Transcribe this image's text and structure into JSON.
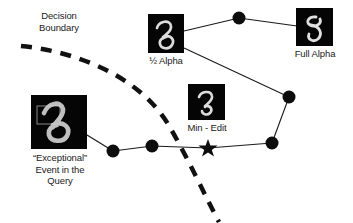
{
  "diagram": {
    "title_text_present": false,
    "background_color": "#ffffff",
    "stroke_color": "#1a1a1a",
    "node_color": "#0d0d0d",
    "thumbnail_bg": "#050505",
    "digit_stroke_color": "#d8d8d8",
    "highlight_box_color": "#8a8a8a",
    "labels": {
      "decision_boundary": "Decision\nBoundary",
      "half_alpha": "½ Alpha",
      "full_alpha": "Full Alpha",
      "min_edit": "Min - Edit",
      "exceptional_event": "“Exceptional”\nEvent in the\nQuery"
    },
    "thumbnails": [
      {
        "name": "query-digit-thumbnail",
        "label_key": "exceptional_event",
        "x": 31,
        "y": 95,
        "w": 56,
        "h": 54,
        "has_highlight_box": true
      },
      {
        "name": "half-alpha-digit-thumbnail",
        "label_key": "half_alpha",
        "x": 148,
        "y": 14,
        "w": 36,
        "h": 39,
        "has_highlight_box": false
      },
      {
        "name": "min-edit-digit-thumbnail",
        "label_key": "min_edit",
        "x": 188,
        "y": 84,
        "w": 37,
        "h": 36,
        "has_highlight_box": false
      },
      {
        "name": "full-alpha-digit-thumbnail",
        "label_key": "full_alpha",
        "x": 296,
        "y": 8,
        "w": 37,
        "h": 38,
        "has_highlight_box": false
      }
    ],
    "nodes": [
      {
        "name": "node-path-1",
        "x": 113,
        "y": 151,
        "r": 6.5
      },
      {
        "name": "node-path-2",
        "x": 152,
        "y": 146,
        "r": 6.5
      },
      {
        "name": "node-top",
        "x": 239,
        "y": 18,
        "r": 6.5
      },
      {
        "name": "node-right-upper",
        "x": 289,
        "y": 97,
        "r": 6.5
      },
      {
        "name": "node-right-lower",
        "x": 272,
        "y": 143,
        "r": 6.5
      }
    ],
    "star_marker": {
      "name": "min-edit-star-marker",
      "x": 208,
      "y": 148,
      "r": 8
    },
    "edges": [
      {
        "from": "query-thumbnail",
        "to": "node-path-1",
        "x1": 87,
        "y1": 135,
        "x2": 113,
        "y2": 151
      },
      {
        "from": "node-path-1",
        "to": "node-path-2",
        "x1": 113,
        "y1": 151,
        "x2": 152,
        "y2": 146
      },
      {
        "from": "node-path-2",
        "to": "star-marker",
        "x1": 152,
        "y1": 146,
        "x2": 208,
        "y2": 148
      },
      {
        "from": "star-marker",
        "to": "node-right-lower",
        "x1": 208,
        "y1": 148,
        "x2": 272,
        "y2": 143
      },
      {
        "from": "node-right-lower",
        "to": "node-right-upper",
        "x1": 272,
        "y1": 143,
        "x2": 289,
        "y2": 97
      },
      {
        "from": "node-right-upper",
        "to": "half-alpha-thumbnail",
        "x1": 289,
        "y1": 97,
        "x2": 184,
        "y2": 48
      },
      {
        "from": "half-alpha-thumbnail",
        "to": "node-top",
        "x1": 184,
        "y1": 31,
        "x2": 239,
        "y2": 18
      },
      {
        "from": "node-top",
        "to": "full-alpha-thumbnail",
        "x1": 239,
        "y1": 18,
        "x2": 296,
        "y2": 26
      }
    ],
    "decision_boundary_curve": {
      "name": "decision-boundary-dashed-curve",
      "path": "M 21 46 C 80 52, 140 78, 168 124 C 188 158, 205 196, 219 222",
      "dash_pattern": "11 9",
      "stroke_width": 4.5
    }
  }
}
